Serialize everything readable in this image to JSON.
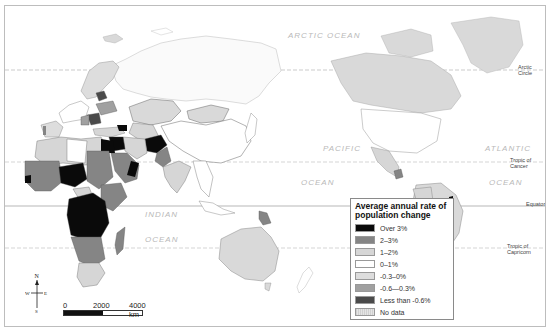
{
  "map": {
    "title": "Average annual rate of population change",
    "colors": {
      "over_3": "#0a0a0a",
      "2_3": "#858585",
      "1_2": "#d6d6d6",
      "0_1": "#ffffff",
      "neg03_0": "#dddddd",
      "neg06_neg03": "#a0a0a0",
      "less_neg06": "#4a4a4a",
      "no_data": "#d9d9d9",
      "border": "#555555",
      "grid_line": "#9a9a9a"
    },
    "oceans": [
      {
        "label": "ARCTIC OCEAN"
      },
      {
        "label": "PACIFIC"
      },
      {
        "label": "OCEAN"
      },
      {
        "label": "ATLANTIC"
      },
      {
        "label": "OCEAN"
      },
      {
        "label": "INDIAN"
      },
      {
        "label": "OCEAN"
      }
    ],
    "lines": {
      "arctic_circle": "Arctic Circle",
      "tropic_cancer": "Tropic of Cancer",
      "equator": "Equator",
      "tropic_capricorn": "Tropic of Capricorn"
    }
  },
  "legend": {
    "title": "Average annual rate of population change",
    "items": [
      {
        "label": "Over 3%",
        "color": "#0a0a0a"
      },
      {
        "label": "2–3%",
        "color": "#858585"
      },
      {
        "label": "1–2%",
        "color": "#d6d6d6"
      },
      {
        "label": "0–1%",
        "color": "#ffffff"
      },
      {
        "label": "-0.3–0%",
        "color": "#dddddd"
      },
      {
        "label": "-0.6—0.3%",
        "color": "#a0a0a0"
      },
      {
        "label": "Less than -0.6%",
        "color": "#4a4a4a"
      },
      {
        "label": "No data",
        "color": "#d9d9d9"
      }
    ]
  },
  "compass": {
    "n": "N",
    "s": "S",
    "e": "E",
    "w": "W"
  },
  "scale": {
    "ticks": [
      "0",
      "2000",
      "4000 km"
    ]
  }
}
